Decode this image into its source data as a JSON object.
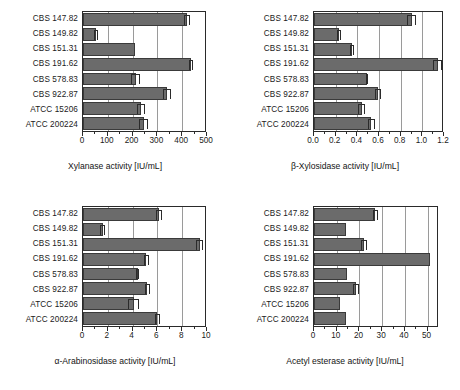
{
  "figure": {
    "categories": [
      "CBS 147.82",
      "CBS 149.82",
      "CBS 151.31",
      "CBS 191.62",
      "CBS 578.83",
      "CBS 922.87",
      "ATCC 15206",
      "ATCC 200224"
    ],
    "bar_color": "#6b6b6b",
    "bar_edge_color": "#3a3a3a",
    "grid_color": "#9a9a9a",
    "axis_color": "#2a2a2a"
  },
  "chart_data": [
    {
      "id": "xylanase",
      "type": "bar",
      "orientation": "horizontal",
      "title": "",
      "xlabel": "Xylanase activity [IU/mL]",
      "ylabel": "",
      "xlim": [
        0,
        500
      ],
      "xticks": [
        0,
        100,
        200,
        300,
        400,
        500
      ],
      "xtick_labels": [
        "0",
        "100",
        "200",
        "300",
        "400",
        "500"
      ],
      "grid": true,
      "legend": "none",
      "categories": [
        "CBS 147.82",
        "CBS 149.82",
        "CBS 151.31",
        "CBS 191.62",
        "CBS 578.83",
        "CBS 922.87",
        "ATCC 15206",
        "ATCC 200224"
      ],
      "values": [
        420,
        52,
        210,
        435,
        213,
        338,
        233,
        245
      ],
      "errors": [
        12,
        8,
        0,
        8,
        18,
        15,
        15,
        18
      ]
    },
    {
      "id": "beta-xylosidase",
      "type": "bar",
      "orientation": "horizontal",
      "title": "",
      "xlabel": "β-Xylosidase activity [IU/mL]",
      "ylabel": "",
      "xlim": [
        0,
        1.2
      ],
      "xticks": [
        0.0,
        0.2,
        0.4,
        0.6,
        0.8,
        1.0,
        1.2
      ],
      "xtick_labels": [
        "0.0",
        "0.2",
        "0.4",
        "0.6",
        "0.8",
        "1.0",
        "1.2"
      ],
      "grid": true,
      "legend": "none",
      "categories": [
        "CBS 147.82",
        "CBS 149.82",
        "CBS 151.31",
        "CBS 191.62",
        "CBS 578.83",
        "CBS 922.87",
        "ATCC 15206",
        "ATCC 200224"
      ],
      "values": [
        0.9,
        0.23,
        0.35,
        1.14,
        0.49,
        0.59,
        0.44,
        0.53
      ],
      "errors": [
        0.04,
        0.02,
        0.02,
        0.04,
        0.01,
        0.03,
        0.03,
        0.03
      ]
    },
    {
      "id": "alpha-arabinosidase",
      "type": "bar",
      "orientation": "horizontal",
      "title": "",
      "xlabel": "α-Arabinosidase activity [IU/mL]",
      "ylabel": "",
      "xlim": [
        0,
        10
      ],
      "xticks": [
        0,
        2,
        4,
        6,
        8,
        10
      ],
      "xtick_labels": [
        "0",
        "2",
        "4",
        "6",
        "8",
        "10"
      ],
      "grid": true,
      "legend": "none",
      "categories": [
        "CBS 147.82",
        "CBS 149.82",
        "CBS 151.31",
        "CBS 191.62",
        "CBS 578.83",
        "CBS 922.87",
        "ATCC 15206",
        "ATCC 200224"
      ],
      "values": [
        6.1,
        1.6,
        9.4,
        5.1,
        4.4,
        5.2,
        4.1,
        6.0
      ],
      "errors": [
        0.25,
        0.2,
        0.3,
        0.22,
        0.15,
        0.2,
        0.45,
        0.2
      ]
    },
    {
      "id": "acetyl-esterase",
      "type": "bar",
      "orientation": "horizontal",
      "title": "",
      "xlabel": "Acetyl esterase activity [IU/mL]",
      "ylabel": "",
      "xlim": [
        0,
        55
      ],
      "xticks": [
        0,
        10,
        20,
        30,
        40,
        50
      ],
      "xtick_labels": [
        "0",
        "10",
        "20",
        "30",
        "40",
        "50"
      ],
      "grid": true,
      "legend": "none",
      "categories": [
        "CBS 147.82",
        "CBS 149.82",
        "CBS 151.31",
        "CBS 191.62",
        "CBS 578.83",
        "CBS 922.87",
        "ATCC 15206",
        "ATCC 200224"
      ],
      "values": [
        27,
        14,
        22,
        51,
        14.5,
        18.5,
        11.5,
        14
      ],
      "errors": [
        1.2,
        0,
        1.2,
        0,
        0,
        1.5,
        0,
        0
      ]
    }
  ]
}
